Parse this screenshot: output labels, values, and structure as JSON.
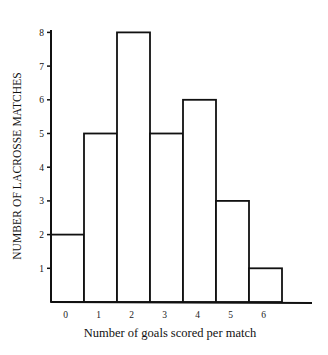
{
  "chart_data": {
    "type": "bar",
    "subtype": "histogram",
    "title": "",
    "xlabel": "Number of goals scored per match",
    "ylabel": "NUMBER OF LACROSSE MATCHES",
    "categories": [
      "0",
      "1",
      "2",
      "3",
      "4",
      "5",
      "6"
    ],
    "values": [
      2,
      5,
      8,
      5,
      6,
      3,
      1
    ],
    "yticks": [
      "1",
      "2",
      "3",
      "4",
      "5",
      "6",
      "7",
      "8"
    ],
    "ylim": [
      0,
      8
    ],
    "grid": false,
    "legend": null,
    "colors": {
      "bar_fill": "#ffffff",
      "bar_stroke": "#111111",
      "axis": "#111111"
    }
  }
}
